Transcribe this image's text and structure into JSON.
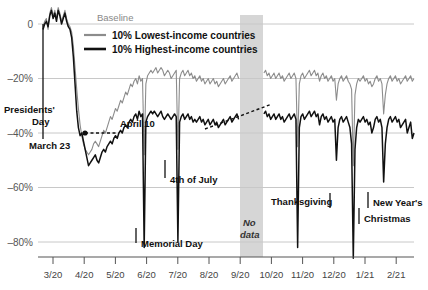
{
  "chart_data": {
    "type": "line",
    "title": "",
    "subtitle": "",
    "xlabel": "",
    "ylabel": "",
    "grid": true,
    "legend_position": "top-left",
    "ylim": [
      -90,
      8
    ],
    "y_ticks": [
      "0",
      "–20%",
      "–40%",
      "–60%",
      "–80%"
    ],
    "y_tick_values": [
      0,
      -20,
      -40,
      -60,
      -80
    ],
    "x_ticks": [
      "3/20",
      "4/20",
      "5/20",
      "6/20",
      "7/20",
      "8/20",
      "9/20",
      "10/20",
      "11/20",
      "12/20",
      "1/21",
      "2/21"
    ],
    "baseline_label": "Baseline",
    "no_data_label_line1": "No",
    "no_data_label_line2": "data",
    "colors": {
      "lowest_income": "#8c8c8c",
      "highest_income": "#111111",
      "grid": "#c8c8c8",
      "no_data_band": "#d6d6d6",
      "axis": "#555555"
    },
    "series": [
      {
        "name": "10% Lowest-income countries",
        "color": "#8c8c8c",
        "values": [
          -1,
          1,
          2,
          -2,
          4,
          6,
          3,
          5,
          2,
          6,
          4,
          1,
          3,
          5,
          2,
          0,
          -1,
          -3,
          -8,
          -16,
          -24,
          -31,
          -37,
          -41,
          -44,
          -46,
          -47,
          -48,
          -47,
          -46,
          -44,
          -43,
          -44,
          -45,
          -43,
          -41,
          -39,
          -40,
          -38,
          -36,
          -34,
          -35,
          -33,
          -31,
          -32,
          -30,
          -28,
          -29,
          -27,
          -25,
          -26,
          -24,
          -22,
          -23,
          -21,
          -20,
          -22,
          -19,
          -21,
          -20,
          -48,
          -22,
          -19,
          -18,
          -17,
          -18,
          -17,
          -16,
          -18,
          -17,
          -16,
          -17,
          -19,
          -18,
          -17,
          -18,
          -20,
          -19,
          -18,
          -17,
          -46,
          -20,
          -18,
          -17,
          -19,
          -18,
          -17,
          -19,
          -18,
          -20,
          -19,
          -21,
          -20,
          -19,
          -21,
          -20,
          -22,
          -21,
          -20,
          -22,
          -21,
          -20,
          -22,
          -21,
          -23,
          -22,
          -21,
          -20,
          -22,
          -21,
          -20,
          -19,
          -21,
          -20,
          -19,
          -18,
          -20,
          -19,
          -18,
          -20,
          -19,
          -18,
          -17,
          -19,
          -18,
          -17,
          -19,
          -18,
          -17,
          -19,
          -21,
          -18,
          -17,
          -19,
          -18,
          -20,
          -19,
          -18,
          -20,
          -19,
          -18,
          -20,
          -19,
          -21,
          -20,
          -19,
          -18,
          -20,
          -19,
          -18,
          -20,
          -45,
          -22,
          -19,
          -18,
          -20,
          -19,
          -18,
          -17,
          -19,
          -18,
          -17,
          -19,
          -18,
          -21,
          -19,
          -18,
          -20,
          -19,
          -21,
          -20,
          -19,
          -21,
          -20,
          -28,
          -22,
          -20,
          -19,
          -21,
          -20,
          -19,
          -21,
          -22,
          -24,
          -52,
          -26,
          -22,
          -20,
          -21,
          -20,
          -19,
          -21,
          -20,
          -22,
          -21,
          -23,
          -22,
          -20,
          -19,
          -21,
          -20,
          -22,
          -33,
          -26,
          -22,
          -20,
          -19,
          -21,
          -20,
          -19,
          -21,
          -20,
          -22,
          -21,
          -20,
          -19,
          -21,
          -20,
          -19,
          -21,
          -20
        ]
      },
      {
        "name": "10% Highest-income countries",
        "color": "#111111",
        "values": [
          -2,
          0,
          1,
          -1,
          3,
          5,
          2,
          4,
          1,
          5,
          3,
          0,
          2,
          4,
          1,
          -1,
          -2,
          -5,
          -12,
          -22,
          -32,
          -38,
          -41,
          -40,
          -43,
          -46,
          -49,
          -52,
          -51,
          -50,
          -49,
          -48,
          -50,
          -51,
          -49,
          -47,
          -46,
          -47,
          -45,
          -44,
          -43,
          -44,
          -42,
          -41,
          -42,
          -40,
          -39,
          -40,
          -38,
          -37,
          -38,
          -36,
          -35,
          -36,
          -34,
          -33,
          -35,
          -32,
          -34,
          -33,
          -82,
          -36,
          -34,
          -33,
          -32,
          -33,
          -32,
          -33,
          -34,
          -33,
          -32,
          -34,
          -35,
          -34,
          -33,
          -34,
          -35,
          -34,
          -33,
          -34,
          -80,
          -36,
          -34,
          -33,
          -35,
          -34,
          -33,
          -35,
          -34,
          -36,
          -35,
          -36,
          -35,
          -34,
          -36,
          -35,
          -37,
          -36,
          -35,
          -37,
          -36,
          -35,
          -37,
          -36,
          -38,
          -37,
          -36,
          -35,
          -37,
          -36,
          -35,
          -34,
          -36,
          -35,
          -34,
          -33,
          -35,
          -34,
          -33,
          -35,
          -34,
          -33,
          -32,
          -34,
          -33,
          -32,
          -34,
          -33,
          -32,
          -34,
          -40,
          -33,
          -32,
          -34,
          -33,
          -35,
          -34,
          -33,
          -35,
          -34,
          -33,
          -35,
          -34,
          -36,
          -35,
          -34,
          -33,
          -35,
          -34,
          -33,
          -35,
          -82,
          -38,
          -34,
          -33,
          -35,
          -34,
          -33,
          -32,
          -34,
          -33,
          -32,
          -34,
          -33,
          -37,
          -34,
          -33,
          -35,
          -34,
          -36,
          -35,
          -34,
          -36,
          -35,
          -50,
          -38,
          -35,
          -34,
          -36,
          -35,
          -34,
          -36,
          -38,
          -44,
          -86,
          -46,
          -38,
          -35,
          -36,
          -35,
          -34,
          -36,
          -35,
          -37,
          -36,
          -40,
          -38,
          -35,
          -34,
          -36,
          -35,
          -38,
          -58,
          -44,
          -38,
          -35,
          -34,
          -36,
          -35,
          -34,
          -36,
          -35,
          -38,
          -37,
          -36,
          -35,
          -40,
          -38,
          -36,
          -42,
          -40
        ]
      }
    ],
    "annotations": [
      {
        "name": "presidents-day",
        "label": "Presidents'",
        "label2": "Day"
      },
      {
        "name": "march-23",
        "label": "March 23"
      },
      {
        "name": "april-10",
        "label": "April 10"
      },
      {
        "name": "memorial-day",
        "label": "Memorial Day"
      },
      {
        "name": "fourth-of-july",
        "label": "4th of July"
      },
      {
        "name": "thanksgiving",
        "label": "Thanksgiving"
      },
      {
        "name": "christmas",
        "label": "Christmas"
      },
      {
        "name": "new-years",
        "label": "New Year's"
      }
    ]
  }
}
